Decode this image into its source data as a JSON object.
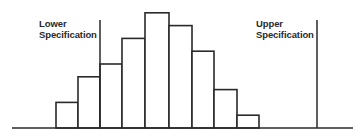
{
  "chart_data": {
    "type": "bar",
    "title": "",
    "xlabel": "",
    "ylabel": "",
    "grid": false,
    "legend": null,
    "categories": [
      "1",
      "2",
      "3",
      "4",
      "5",
      "6",
      "7",
      "8",
      "9"
    ],
    "values": [
      2,
      4,
      5,
      7,
      9,
      8,
      6,
      3,
      1
    ],
    "ylim": [
      0,
      10
    ],
    "annotations": [
      {
        "type": "vertical_line",
        "label_line1": "Lower",
        "label_line2": "Specification",
        "position": "between bar 2 and bar 3"
      },
      {
        "type": "vertical_line",
        "label_line1": "Upper",
        "label_line2": "Specification",
        "position": "right of all bars"
      }
    ],
    "style": {
      "bar_fill": "#ffffff",
      "bar_stroke": "#2a2a2a",
      "line_color": "#2a2a2a"
    }
  },
  "labels": {
    "lower_spec": {
      "line1": "Lower",
      "line2": "Specification"
    },
    "upper_spec": {
      "line1": "Upper",
      "line2": "Specification"
    }
  },
  "layout": {
    "baseline_y": 128,
    "baseline_x_start": 12,
    "baseline_x_end": 353,
    "bar_edges": [
      56,
      78,
      100,
      122,
      145,
      169,
      192,
      214,
      237,
      259
    ],
    "unit_px": 12.8,
    "lower_spec_x": 100,
    "upper_spec_x": 317,
    "spec_line_top_y": 20
  }
}
